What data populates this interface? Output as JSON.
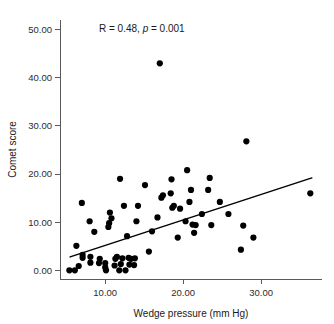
{
  "chart_data": {
    "type": "scatter",
    "title": "",
    "subtitle": "",
    "xlabel": "Wedge pressure (mm Hg)",
    "ylabel": "Comet score",
    "xlim": [
      4.2,
      37.8
    ],
    "ylim": [
      -1.8,
      52.0
    ],
    "grid": false,
    "legend": null,
    "xticks": [
      10,
      20,
      30
    ],
    "xticklabels": [
      "10.00",
      "20.00",
      "30.00"
    ],
    "yticks": [
      0,
      10,
      20,
      30,
      40,
      50
    ],
    "yticklabels": [
      "0.00",
      "10.00",
      "20.00",
      "30.00",
      "40.00",
      "50.00"
    ],
    "annotations": [
      {
        "name": "correlation-annotation",
        "parts": [
          {
            "text": "R = 0.48, ",
            "style": "normal"
          },
          {
            "text": "p",
            "style": "italic"
          },
          {
            "text": " = 0.001",
            "style": "normal"
          }
        ],
        "plain_text": "R = 0.48, p = 0.001",
        "x": 9.2,
        "y": 49.5
      }
    ],
    "statistics": {
      "R": 0.48,
      "p": 0.001,
      "n": 75
    },
    "series": [
      {
        "name": "comet-score-vs-wedge-pressure",
        "marker": "filled-circle",
        "color": "#000000",
        "marker_size": 3.1,
        "points": [
          [
            5.4,
            0.0
          ],
          [
            6.1,
            0.0
          ],
          [
            6.3,
            5.1
          ],
          [
            6.6,
            0.9
          ],
          [
            7.0,
            14.0
          ],
          [
            7.1,
            2.6
          ],
          [
            7.1,
            3.2
          ],
          [
            8.0,
            10.2
          ],
          [
            8.1,
            1.6
          ],
          [
            8.1,
            2.8
          ],
          [
            8.6,
            8.0
          ],
          [
            9.2,
            1.5
          ],
          [
            9.3,
            2.4
          ],
          [
            10.0,
            0.6
          ],
          [
            10.0,
            1.5
          ],
          [
            10.1,
            0.0
          ],
          [
            10.4,
            9.0
          ],
          [
            10.5,
            9.8
          ],
          [
            10.6,
            12.0
          ],
          [
            10.8,
            10.8
          ],
          [
            11.2,
            1.0
          ],
          [
            11.3,
            2.4
          ],
          [
            11.5,
            2.8
          ],
          [
            11.8,
            0.0
          ],
          [
            11.9,
            19.0
          ],
          [
            12.0,
            1.3
          ],
          [
            12.2,
            2.5
          ],
          [
            12.4,
            13.4
          ],
          [
            12.6,
            0.0
          ],
          [
            12.8,
            7.1
          ],
          [
            13.0,
            2.6
          ],
          [
            13.1,
            1.2
          ],
          [
            13.3,
            2.4
          ],
          [
            13.7,
            1.1
          ],
          [
            13.8,
            2.5
          ],
          [
            14.0,
            10.2
          ],
          [
            14.2,
            13.4
          ],
          [
            15.1,
            17.7
          ],
          [
            15.6,
            3.9
          ],
          [
            16.0,
            8.1
          ],
          [
            16.7,
            11.0
          ],
          [
            17.0,
            43.0
          ],
          [
            17.2,
            15.1
          ],
          [
            17.4,
            15.6
          ],
          [
            18.4,
            16.0
          ],
          [
            18.5,
            18.9
          ],
          [
            18.6,
            13.0
          ],
          [
            18.8,
            13.4
          ],
          [
            19.3,
            6.8
          ],
          [
            19.6,
            12.8
          ],
          [
            20.3,
            10.2
          ],
          [
            20.5,
            20.8
          ],
          [
            20.8,
            14.2
          ],
          [
            21.0,
            16.7
          ],
          [
            21.2,
            9.5
          ],
          [
            21.4,
            7.8
          ],
          [
            21.6,
            9.4
          ],
          [
            22.4,
            11.7
          ],
          [
            23.2,
            16.7
          ],
          [
            23.4,
            19.2
          ],
          [
            23.6,
            9.4
          ],
          [
            24.7,
            14.2
          ],
          [
            25.8,
            11.7
          ],
          [
            27.4,
            4.3
          ],
          [
            27.7,
            9.3
          ],
          [
            28.1,
            26.8
          ],
          [
            29.0,
            6.8
          ],
          [
            36.3,
            16.0
          ]
        ]
      }
    ],
    "fit_line": {
      "name": "regression-line",
      "type": "linear",
      "color": "#000000",
      "x_start": 5.5,
      "y_start": 2.8,
      "x_end": 36.5,
      "y_end": 19.2
    }
  }
}
